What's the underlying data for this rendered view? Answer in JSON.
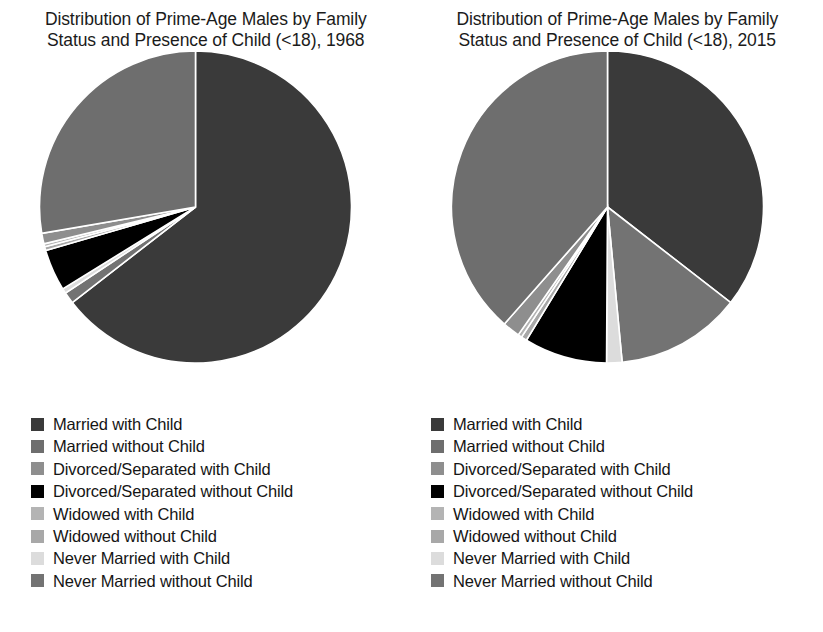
{
  "panels": [
    {
      "id": "pie-1968",
      "title_line1": "Distribution of Prime-Age Males by Family",
      "title_line2": "Status and Presence of Child (<18), 1968"
    },
    {
      "id": "pie-2015",
      "title_line1": "Distribution of Prime-Age Males by Family",
      "title_line2": "Status and Presence of Child (<18), 2015"
    }
  ],
  "legend": {
    "items": [
      {
        "label": "Married with Child",
        "color": "#3a3a3a"
      },
      {
        "label": "Married without Child",
        "color": "#6e6e6e"
      },
      {
        "label": "Divorced/Separated with Child",
        "color": "#8e8e8e"
      },
      {
        "label": "Divorced/Separated without Child",
        "color": "#000000"
      },
      {
        "label": "Widowed with Child",
        "color": "#b4b4b4"
      },
      {
        "label": "Widowed without Child",
        "color": "#a8a8a8"
      },
      {
        "label": "Never Married with Child",
        "color": "#dcdcdc"
      },
      {
        "label": "Never Married without Child",
        "color": "#737373"
      }
    ]
  },
  "chart_data": [
    {
      "type": "pie",
      "title": "Distribution of Prime-Age Males by Family Status and Presence of Child (<18), 1968",
      "year": "1968",
      "start_angle": 0,
      "direction": "clockwise",
      "labels": [
        "Married with Child",
        "Never Married without Child",
        "Never Married with Child",
        "Divorced/Separated without Child",
        "Widowed without Child",
        "Widowed with Child",
        "Divorced/Separated with Child",
        "Married without Child"
      ],
      "values": [
        64.5,
        1.2,
        0.5,
        4.3,
        0.4,
        0.3,
        1.1,
        27.7
      ],
      "colors": [
        "#3a3a3a",
        "#737373",
        "#dcdcdc",
        "#000000",
        "#a8a8a8",
        "#b4b4b4",
        "#8e8e8e",
        "#6e6e6e"
      ],
      "units": "percent"
    },
    {
      "type": "pie",
      "title": "Distribution of Prime-Age Males by Family Status and Presence of Child (<18), 2015",
      "year": "2015",
      "start_angle": 0,
      "direction": "clockwise",
      "labels": [
        "Married with Child",
        "Never Married without Child",
        "Never Married with Child",
        "Divorced/Separated without Child",
        "Widowed without Child",
        "Widowed with Child",
        "Divorced/Separated with Child",
        "Married without Child"
      ],
      "values": [
        35.5,
        13.0,
        1.6,
        8.6,
        0.6,
        0.4,
        1.8,
        38.5
      ],
      "colors": [
        "#3a3a3a",
        "#737373",
        "#dcdcdc",
        "#000000",
        "#a8a8a8",
        "#b4b4b4",
        "#8e8e8e",
        "#6e6e6e"
      ],
      "units": "percent"
    }
  ]
}
